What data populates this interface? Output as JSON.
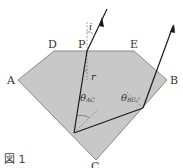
{
  "figure": {
    "caption": "図 1",
    "points": {
      "A": "A",
      "B": "B",
      "C": "C",
      "D": "D",
      "E": "E",
      "P": "P"
    },
    "angles": {
      "incidence": "i",
      "refraction": "r",
      "theta_ac": "θ",
      "theta_ac_sub": "AC",
      "theta_bc": "θ",
      "theta_bc_sub": "BC"
    },
    "colors": {
      "fill": "#c8c8c8",
      "edge": "#888888",
      "ray": "#1a1a1a"
    }
  }
}
